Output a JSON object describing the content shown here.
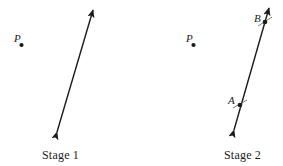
{
  "figure": {
    "width": 283,
    "height": 166,
    "background_color": "#ffffff",
    "ink_color": "#1b1b1b"
  },
  "stages": [
    {
      "id": "stage-1",
      "caption": "Stage 1",
      "caption_position": {
        "x": 42,
        "y": 148
      },
      "points": [
        {
          "name": "P",
          "label": "P",
          "label_position": {
            "x": 14,
            "y": 33
          },
          "dot_position": {
            "x": 21.5,
            "y": 45
          },
          "dot_radius": 2.1,
          "on_line": false
        }
      ],
      "lines": [
        {
          "name": "double-arrow-line",
          "x1": 57,
          "y1": 132,
          "x2": 93,
          "y2": 10,
          "stroke_width": 1.4,
          "arrow_start": true,
          "arrow_end": true
        }
      ],
      "tick_marks": []
    },
    {
      "id": "stage-2",
      "caption": "Stage 2",
      "caption_position": {
        "x": 224,
        "y": 148
      },
      "points": [
        {
          "name": "P",
          "label": "P",
          "label_position": {
            "x": 186,
            "y": 33
          },
          "dot_position": {
            "x": 193.5,
            "y": 45
          },
          "dot_radius": 2.1,
          "on_line": false
        },
        {
          "name": "A",
          "label": "A",
          "label_position": {
            "x": 228,
            "y": 95
          },
          "dot_position": {
            "x": 240,
            "y": 105
          },
          "dot_radius": 2.3,
          "on_line": true
        },
        {
          "name": "B",
          "label": "B",
          "label_position": {
            "x": 254,
            "y": 13
          },
          "dot_position": {
            "x": 265,
            "y": 22
          },
          "dot_radius": 2.3,
          "on_line": true
        }
      ],
      "lines": [
        {
          "name": "double-arrow-line",
          "x1": 234,
          "y1": 130,
          "x2": 269,
          "y2": 8,
          "stroke_width": 1.4,
          "arrow_start": true,
          "arrow_end": true
        }
      ],
      "tick_marks": [
        {
          "name": "tick-at-a",
          "x1": 233,
          "y1": 108,
          "x2": 247,
          "y2": 100
        },
        {
          "name": "tick-at-b",
          "x1": 258,
          "y1": 26,
          "x2": 272,
          "y2": 17
        }
      ]
    }
  ]
}
